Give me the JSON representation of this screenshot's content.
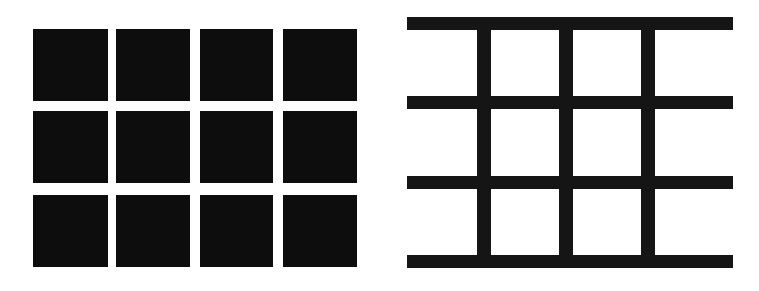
{
  "figure": {
    "background_color": "#ffffff",
    "ink_color": "#0d0d0d",
    "canvas": {
      "width": 759,
      "height": 291
    },
    "panels": [
      {
        "id": "panel-squares",
        "label": "Twelve separate black squares",
        "description": "A 3 by 4 arrangement of twelve discrete black squares separated by white gaps",
        "rows": 3,
        "columns": 4,
        "tile_count": 12
      },
      {
        "id": "panel-grid",
        "label": "Black grid lattice with white squares",
        "description": "Four horizontal black bars crossed by three vertical black bars forming a lattice enclosing white square regions",
        "horizontal_bar_count": 4,
        "vertical_bar_count": 3,
        "enclosed_cells": 12
      }
    ]
  },
  "chart_data": {
    "type": "scatter",
    "subtitle": "",
    "xlabel": "",
    "ylabel": "",
    "grid": false,
    "legend": "none",
    "xlim": [
      0,
      759
    ],
    "ylim": [
      0,
      291
    ],
    "series": [
      {
        "name": "left-panel-squares",
        "shape": "rect",
        "fill": "#0d0d0d",
        "rects": [
          {
            "x": 33,
            "y": 29,
            "w": 75,
            "h": 72
          },
          {
            "x": 116,
            "y": 29,
            "w": 74,
            "h": 72
          },
          {
            "x": 200,
            "y": 29,
            "w": 73,
            "h": 72
          },
          {
            "x": 283,
            "y": 29,
            "w": 74,
            "h": 72
          },
          {
            "x": 33,
            "y": 111,
            "w": 75,
            "h": 72
          },
          {
            "x": 116,
            "y": 111,
            "w": 74,
            "h": 72
          },
          {
            "x": 200,
            "y": 111,
            "w": 73,
            "h": 72
          },
          {
            "x": 283,
            "y": 111,
            "w": 74,
            "h": 72
          },
          {
            "x": 33,
            "y": 195,
            "w": 75,
            "h": 72
          },
          {
            "x": 116,
            "y": 195,
            "w": 74,
            "h": 72
          },
          {
            "x": 200,
            "y": 195,
            "w": 73,
            "h": 72
          },
          {
            "x": 283,
            "y": 195,
            "w": 74,
            "h": 72
          }
        ]
      },
      {
        "name": "right-panel-horizontal-bars",
        "shape": "rect",
        "fill": "#151515",
        "rects": [
          {
            "x": 407,
            "y": 17,
            "w": 326,
            "h": 13
          },
          {
            "x": 407,
            "y": 96,
            "w": 326,
            "h": 13
          },
          {
            "x": 407,
            "y": 176,
            "w": 326,
            "h": 13
          },
          {
            "x": 407,
            "y": 255,
            "w": 326,
            "h": 13
          }
        ]
      },
      {
        "name": "right-panel-vertical-bars",
        "shape": "rect",
        "fill": "#151515",
        "rects": [
          {
            "x": 477,
            "y": 17,
            "w": 14,
            "h": 251
          },
          {
            "x": 559,
            "y": 17,
            "w": 14,
            "h": 251
          },
          {
            "x": 641,
            "y": 17,
            "w": 14,
            "h": 251
          }
        ]
      }
    ]
  }
}
